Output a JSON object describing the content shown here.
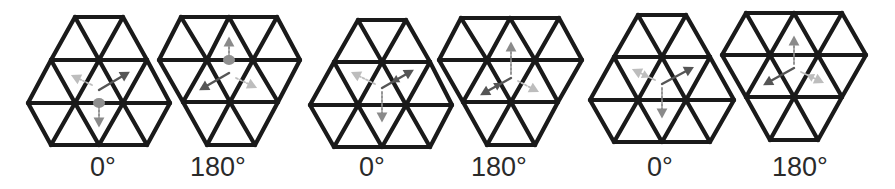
{
  "figure": {
    "colors": {
      "lattice": "#1a1a1a",
      "arrow_dark": "#555555",
      "arrow_mid": "#8a8a8a",
      "arrow_light": "#bdbdbd",
      "dot": "#8f8f8f"
    },
    "panels": [
      {
        "label": "0°",
        "label_x": 103,
        "rows": [
          {
            "y": 17,
            "xs": [
              75,
              123
            ]
          },
          {
            "y": 60,
            "xs": [
              51,
              99,
              147
            ]
          },
          {
            "y": 103,
            "xs": [
              28,
              75,
              123,
              170
            ]
          },
          {
            "y": 145,
            "xs": [
              51,
              99,
              147
            ]
          }
        ],
        "center": [
          99,
          88
        ],
        "dot": [
          99,
          103
        ],
        "arrows": [
          {
            "from": [
              99,
              90
            ],
            "to": [
              126,
              74
            ],
            "tone": "dark",
            "style": "solid"
          },
          {
            "from": [
              92,
              85
            ],
            "to": [
              75,
              77
            ],
            "tone": "light",
            "style": "dashed"
          },
          {
            "from": [
              99,
              106
            ],
            "to": [
              99,
              123
            ],
            "tone": "mid",
            "style": "dashed"
          }
        ]
      },
      {
        "label": "180°",
        "label_x": 218,
        "rows": [
          {
            "y": 17,
            "xs": [
              181,
              229,
              277
            ]
          },
          {
            "y": 60,
            "xs": [
              159,
              207,
              253,
              300
            ]
          },
          {
            "y": 102,
            "xs": [
              183,
              230,
              278
            ]
          },
          {
            "y": 145,
            "xs": [
              207,
              255
            ]
          }
        ],
        "center": [
          229,
          75
        ],
        "dot": [
          229,
          60
        ],
        "arrows": [
          {
            "from": [
              229,
              73
            ],
            "to": [
              203,
              88
            ],
            "tone": "dark",
            "style": "solid"
          },
          {
            "from": [
              236,
              78
            ],
            "to": [
              253,
              86
            ],
            "tone": "light",
            "style": "dashed"
          },
          {
            "from": [
              229,
              57
            ],
            "to": [
              229,
              41
            ],
            "tone": "mid",
            "style": "dashed"
          }
        ]
      },
      {
        "label": "0°",
        "label_x": 372,
        "rows": [
          {
            "y": 20,
            "xs": [
              358,
              406
            ]
          },
          {
            "y": 62,
            "xs": [
              334,
              382,
              430
            ]
          },
          {
            "y": 105,
            "xs": [
              310,
              358,
              406,
              452
            ]
          },
          {
            "y": 147,
            "xs": [
              334,
              382,
              430
            ]
          }
        ],
        "center": [
          382,
          88
        ],
        "dot": null,
        "arrows": [
          {
            "from": [
              382,
              88
            ],
            "to": [
              410,
              72
            ],
            "tone": "dark",
            "style": "solid-double"
          },
          {
            "from": [
              375,
              84
            ],
            "to": [
              355,
              74
            ],
            "tone": "light",
            "style": "dashed"
          },
          {
            "from": [
              382,
              92
            ],
            "to": [
              382,
              118
            ],
            "tone": "mid",
            "style": "dashed"
          }
        ]
      },
      {
        "label": "180°",
        "label_x": 499,
        "rows": [
          {
            "y": 18,
            "xs": [
              461,
              510,
              559
            ]
          },
          {
            "y": 60,
            "xs": [
              439,
              487,
              535,
              582
            ]
          },
          {
            "y": 102,
            "xs": [
              463,
              511,
              558
            ]
          },
          {
            "y": 145,
            "xs": [
              487,
              535
            ]
          }
        ],
        "center": [
          511,
          78
        ],
        "dot": null,
        "arrows": [
          {
            "from": [
              511,
              78
            ],
            "to": [
              484,
              93
            ],
            "tone": "dark",
            "style": "solid-double"
          },
          {
            "from": [
              518,
              81
            ],
            "to": [
              535,
              90
            ],
            "tone": "light",
            "style": "dashed"
          },
          {
            "from": [
              511,
              74
            ],
            "to": [
              511,
              46
            ],
            "tone": "mid",
            "style": "dashed"
          }
        ]
      },
      {
        "label": "0°",
        "label_x": 660,
        "rows": [
          {
            "y": 15,
            "xs": [
              638,
              686
            ]
          },
          {
            "y": 57,
            "xs": [
              614,
              662,
              710
            ]
          },
          {
            "y": 100,
            "xs": [
              590,
              638,
              686,
              734
            ]
          },
          {
            "y": 142,
            "xs": [
              614,
              662,
              710
            ]
          }
        ],
        "center": [
          662,
          84
        ],
        "dot": null,
        "arrows": [
          {
            "from": [
              662,
              84
            ],
            "to": [
              690,
              69
            ],
            "tone": "dark",
            "style": "solid"
          },
          {
            "from": [
              655,
              80
            ],
            "to": [
              636,
              71
            ],
            "tone": "light",
            "style": "solid-double"
          },
          {
            "from": [
              662,
              88
            ],
            "to": [
              662,
              114
            ],
            "tone": "mid",
            "style": "dashed"
          }
        ]
      },
      {
        "label": "180°",
        "label_x": 800,
        "rows": [
          {
            "y": 13,
            "xs": [
              746,
              794,
              842
            ]
          },
          {
            "y": 55,
            "xs": [
              722,
              770,
              818,
              866
            ]
          },
          {
            "y": 97,
            "xs": [
              746,
              794,
              842
            ]
          },
          {
            "y": 140,
            "xs": [
              770,
              818
            ]
          }
        ],
        "center": [
          794,
          68
        ],
        "dot": null,
        "arrows": [
          {
            "from": [
              794,
              68
            ],
            "to": [
              767,
              83
            ],
            "tone": "dark",
            "style": "solid"
          },
          {
            "from": [
              801,
              72
            ],
            "to": [
              820,
              81
            ],
            "tone": "light",
            "style": "solid-double"
          },
          {
            "from": [
              794,
              64
            ],
            "to": [
              794,
              40
            ],
            "tone": "mid",
            "style": "dashed"
          }
        ]
      }
    ]
  }
}
